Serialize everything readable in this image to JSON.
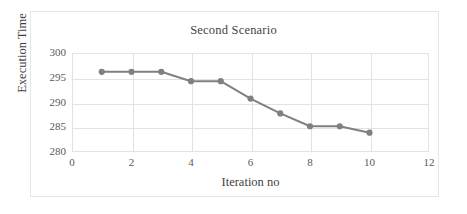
{
  "chart_data": {
    "type": "line",
    "title": "Second Scenario",
    "xlabel": "Iteration no",
    "ylabel": "Execution Time",
    "x": [
      1,
      2,
      3,
      4,
      5,
      6,
      7,
      8,
      9,
      10
    ],
    "values": [
      296.2,
      296.2,
      296.2,
      294.3,
      294.3,
      290.8,
      287.8,
      285.2,
      285.2,
      283.9
    ],
    "series": [
      {
        "name": "Execution Time",
        "values": [
          296.2,
          296.2,
          296.2,
          294.3,
          294.3,
          290.8,
          287.8,
          285.2,
          285.2,
          283.9
        ]
      }
    ],
    "xlim": [
      0,
      12
    ],
    "ylim": [
      280,
      300
    ],
    "xticks": [
      "0",
      "2",
      "4",
      "6",
      "8",
      "10",
      "12"
    ],
    "xtick_values": [
      0,
      2,
      4,
      6,
      8,
      10,
      12
    ],
    "yticks": [
      "280",
      "285",
      "290",
      "295",
      "300"
    ],
    "ytick_values": [
      280,
      285,
      290,
      295,
      300
    ],
    "grid": true,
    "legend": false,
    "legend_position": "none",
    "series_color": "#808080",
    "gridline_color": "#e2e2e2",
    "marker": "circle",
    "marker_size": 5
  }
}
